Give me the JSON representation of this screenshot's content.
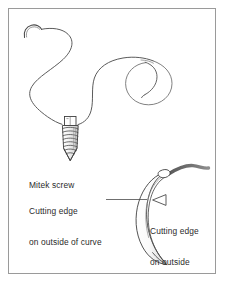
{
  "figure": {
    "type": "medical line illustration",
    "background_color": "#ffffff",
    "frame_color": "#9a9a9a",
    "ink_color": "#3a3a3a",
    "text_color": "#2b2b2b",
    "suture_color": "#5b5b5b",
    "thread_tail_color": "#6f6f6f"
  },
  "labels": {
    "mitek_screw": "Mitek screw",
    "cutting_edge_outside_curve_line1": "Cutting edge",
    "cutting_edge_outside_curve_line2": "on outside of curve",
    "cutting_edge_outside_line1": "Cutting edge",
    "cutting_edge_outside_line2": "on outside"
  },
  "components": {
    "suture_thread": "suture-thread-icon",
    "suture_coil": "suture-coil-icon",
    "needle_hook": "needle-hook-icon",
    "mitek_screw_body": "mitek-screw-icon",
    "screw_head": "screw-head-icon",
    "screw_tip": "screw-tip-icon",
    "curved_needle_blade": "curved-needle-blade-icon",
    "arrow_marker": "arrowhead-left-icon",
    "leader_line": "leader-line"
  }
}
